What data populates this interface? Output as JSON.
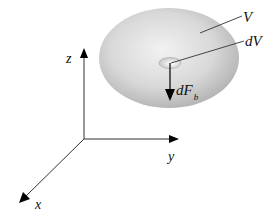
{
  "diagram": {
    "volume_label": "V",
    "element_label": "dV",
    "force_label_main": "dF",
    "force_label_sub": "b",
    "axes": {
      "x": "x",
      "y": "y",
      "z": "z"
    },
    "colors": {
      "body_light": "#f0f0f0",
      "body_dark": "#b4b4b4",
      "line": "#333333",
      "arrow": "#000000"
    }
  }
}
